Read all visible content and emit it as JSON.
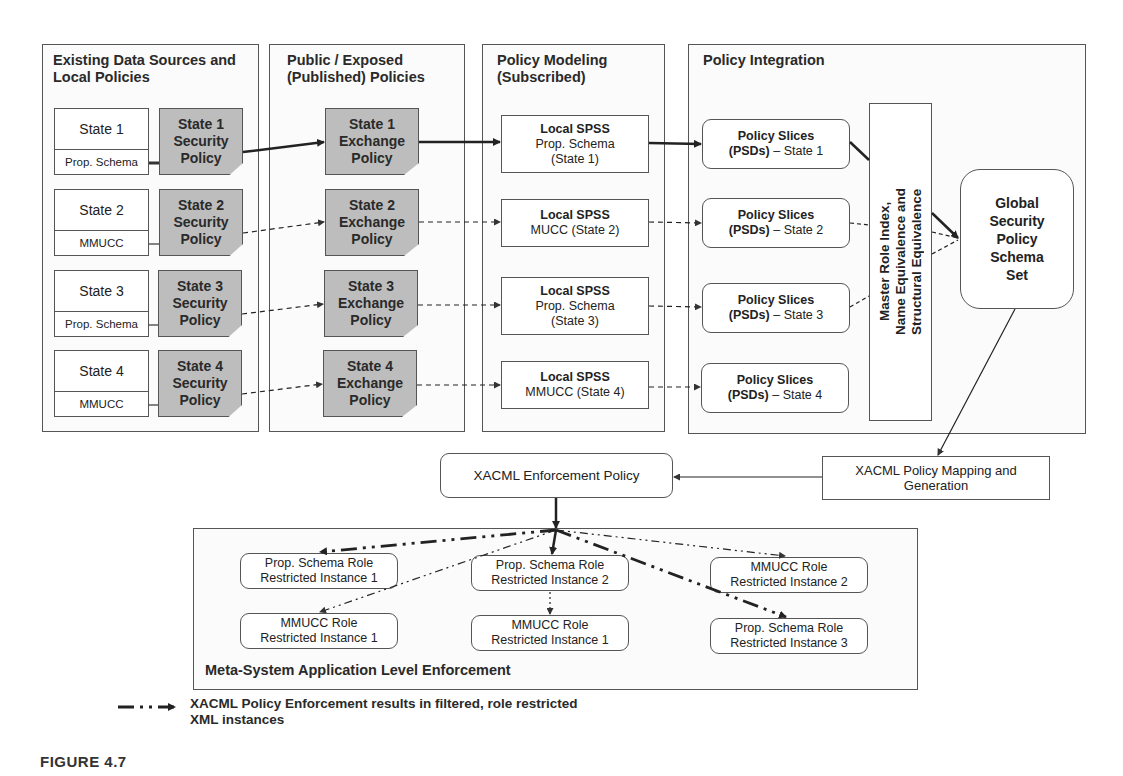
{
  "columns": [
    {
      "title": "Existing Data Sources and Local Policies"
    },
    {
      "title": "Public / Exposed (Published) Policies"
    },
    {
      "title": "Policy Modeling (Subscribed)"
    },
    {
      "title": "Policy Integration"
    }
  ],
  "states": [
    {
      "name": "State 1",
      "schema": "Prop. Schema",
      "security_policy": "State 1 Security Policy",
      "exchange_policy": "State 1 Exchange Policy",
      "spss_title": "Local SPSS",
      "spss_line1": "Prop. Schema",
      "spss_line2": "(State 1)",
      "slice_title": "Policy Slices",
      "slice_bold": "(PSDs)",
      "slice_rest": " – State 1",
      "link_style": "solid"
    },
    {
      "name": "State 2",
      "schema": "MMUCC",
      "security_policy": "State 2 Security Policy",
      "exchange_policy": "State 2 Exchange Policy",
      "spss_title": "Local SPSS",
      "spss_line1": "MUCC (State 2)",
      "spss_line2": "",
      "slice_title": "Policy Slices",
      "slice_bold": "(PSDs)",
      "slice_rest": " – State 2",
      "link_style": "dashed"
    },
    {
      "name": "State 3",
      "schema": "Prop. Schema",
      "security_policy": "State 3 Security Policy",
      "exchange_policy": "State 3 Exchange Policy",
      "spss_title": "Local SPSS",
      "spss_line1": "Prop. Schema",
      "spss_line2": "(State 3)",
      "slice_title": "Policy Slices",
      "slice_bold": "(PSDs)",
      "slice_rest": " – State 3",
      "link_style": "dashed"
    },
    {
      "name": "State 4",
      "schema": "MMUCC",
      "security_policy": "State 4 Security Policy",
      "exchange_policy": "State 4 Exchange Policy",
      "spss_title": "Local SPSS",
      "spss_line1": "MMUCC (State 4)",
      "spss_line2": "",
      "slice_title": "Policy Slices",
      "slice_bold": "(PSDs)",
      "slice_rest": " – State 4",
      "link_style": "dashed"
    }
  ],
  "security_policy_lines": [
    [
      "State 1",
      "Security",
      "Policy"
    ],
    [
      "State 2",
      "Security",
      "Policy"
    ],
    [
      "State 3",
      "Security",
      "Policy"
    ],
    [
      "State 4",
      "Security",
      "Policy"
    ]
  ],
  "exchange_policy_lines": [
    [
      "State 1",
      "Exchange",
      "Policy"
    ],
    [
      "State 2",
      "Exchange",
      "Policy"
    ],
    [
      "State 3",
      "Exchange",
      "Policy"
    ],
    [
      "State 4",
      "Exchange",
      "Policy"
    ]
  ],
  "master_role_index": {
    "line1": "Master Role Index,",
    "line2": "Name Equivalence and",
    "line3": "Structural Equivalence"
  },
  "global_schema": {
    "lines": [
      "Global",
      "Security",
      "Policy",
      "Schema",
      "Set"
    ]
  },
  "xacml_mapping": {
    "line1": "XACML Policy Mapping and",
    "line2": "Generation"
  },
  "xacml_enforcement": {
    "label": "XACML Enforcement Policy"
  },
  "enforcement_panel": {
    "title": "Meta-System Application Level Enforcement",
    "instances": [
      {
        "line1": "Prop. Schema Role",
        "line2": "Restricted Instance 1"
      },
      {
        "line1": "MMUCC Role",
        "line2": "Restricted Instance 1"
      },
      {
        "line1": "Prop. Schema Role",
        "line2": "Restricted Instance 2"
      },
      {
        "line1": "MMUCC Role",
        "line2": "Restricted Instance 1"
      },
      {
        "line1": "MMUCC Role",
        "line2": "Restricted Instance 2"
      },
      {
        "line1": "Prop. Schema Role",
        "line2": "Restricted Instance 3"
      }
    ]
  },
  "legend": {
    "line1": "XACML Policy Enforcement results in filtered, role restricted",
    "line2": "XML instances"
  },
  "caption": "FIGURE 4.7"
}
